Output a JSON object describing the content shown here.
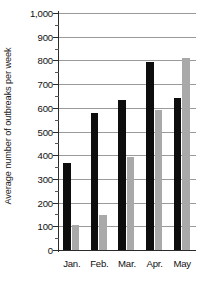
{
  "chart_data": {
    "type": "bar",
    "title": "",
    "xlabel": "",
    "ylabel": "Average number of outbreaks per week",
    "categories": [
      "Jan.",
      "Feb.",
      "Mar.",
      "Apr.",
      "May"
    ],
    "series": [
      {
        "name": "series-black",
        "color": "#0d0d0d",
        "values": [
          368,
          578,
          632,
          795,
          642
        ]
      },
      {
        "name": "series-gray",
        "color": "#a9a9a9",
        "values": [
          104,
          148,
          393,
          590,
          810
        ]
      }
    ],
    "ylim": [
      0,
      1000
    ],
    "y_ticks": [
      0,
      100,
      200,
      300,
      400,
      500,
      600,
      700,
      800,
      900,
      1000
    ],
    "y_tick_labels": [
      "0",
      "100",
      "200",
      "300",
      "400",
      "500",
      "600",
      "700",
      "800",
      "900",
      "1,000"
    ],
    "y_minor_tick_interval": 50,
    "grid": true,
    "grid_axis": "y",
    "legend": null,
    "legend_position": "none"
  }
}
